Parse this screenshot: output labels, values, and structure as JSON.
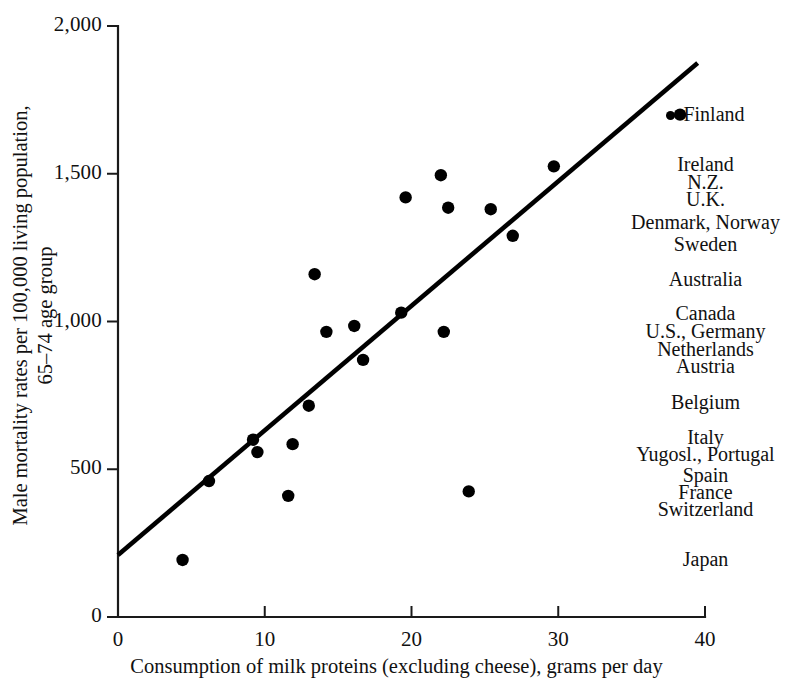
{
  "chart_data": {
    "type": "scatter",
    "title": "",
    "xlabel": "Consumption of milk proteins (excluding cheese), grams per day",
    "ylabel_line1": "Male mortality rates per 100,000 living population,",
    "ylabel_line2": "65–74 age group",
    "xlim": [
      0,
      40
    ],
    "ylim": [
      0,
      2000
    ],
    "xticks": [
      0,
      10,
      20,
      30,
      40
    ],
    "xtick_labels": [
      "0",
      "10",
      "20",
      "30",
      "40"
    ],
    "yticks": [
      0,
      500,
      1000,
      1500,
      2000
    ],
    "ytick_labels": [
      "0",
      "500",
      "1,000",
      "1,500",
      "2,000"
    ],
    "grid": false,
    "legend_position": "right-outside",
    "points": [
      {
        "x": 4.4,
        "y": 193
      },
      {
        "x": 6.2,
        "y": 460
      },
      {
        "x": 9.2,
        "y": 600
      },
      {
        "x": 9.5,
        "y": 558
      },
      {
        "x": 11.6,
        "y": 410
      },
      {
        "x": 11.9,
        "y": 585
      },
      {
        "x": 13.0,
        "y": 715
      },
      {
        "x": 13.4,
        "y": 1160
      },
      {
        "x": 14.2,
        "y": 965
      },
      {
        "x": 16.1,
        "y": 985
      },
      {
        "x": 16.7,
        "y": 870
      },
      {
        "x": 19.3,
        "y": 1030
      },
      {
        "x": 19.6,
        "y": 1420
      },
      {
        "x": 22.0,
        "y": 1495
      },
      {
        "x": 22.2,
        "y": 965
      },
      {
        "x": 22.5,
        "y": 1385
      },
      {
        "x": 23.9,
        "y": 425
      },
      {
        "x": 25.4,
        "y": 1380
      },
      {
        "x": 26.9,
        "y": 1290
      },
      {
        "x": 29.7,
        "y": 1525
      },
      {
        "x": 38.3,
        "y": 1700
      }
    ],
    "trendline": {
      "x0": 0,
      "y0": 210,
      "x1": 39.5,
      "y1": 1875
    },
    "series_name": "Countries",
    "annotations": [
      {
        "label": "Finland",
        "y_value": 1700,
        "has_marker": true
      },
      {
        "label": "Ireland",
        "y_value": 1530,
        "has_marker": false
      },
      {
        "label": "N.Z.",
        "y_value": 1470,
        "has_marker": false
      },
      {
        "label": "U.K.",
        "y_value": 1410,
        "has_marker": false
      },
      {
        "label": "Denmark, Norway",
        "y_value": 1335,
        "has_marker": false
      },
      {
        "label": "Sweden",
        "y_value": 1260,
        "has_marker": false
      },
      {
        "label": "Australia",
        "y_value": 1140,
        "has_marker": false
      },
      {
        "label": "Canada",
        "y_value": 1025,
        "has_marker": false
      },
      {
        "label": "U.S., Germany",
        "y_value": 965,
        "has_marker": false
      },
      {
        "label": "Netherlands",
        "y_value": 905,
        "has_marker": false
      },
      {
        "label": "Austria",
        "y_value": 845,
        "has_marker": false
      },
      {
        "label": "Belgium",
        "y_value": 725,
        "has_marker": false
      },
      {
        "label": "Italy",
        "y_value": 605,
        "has_marker": false
      },
      {
        "label": "Yugosl., Portugal",
        "y_value": 548,
        "has_marker": false
      },
      {
        "label": "Spain",
        "y_value": 478,
        "has_marker": false
      },
      {
        "label": "France",
        "y_value": 420,
        "has_marker": false
      },
      {
        "label": "Switzerland",
        "y_value": 362,
        "has_marker": false
      },
      {
        "label": "Japan",
        "y_value": 193,
        "has_marker": false
      }
    ],
    "colors": {
      "marker": "#000000",
      "trendline": "#000000",
      "axis": "#1a1a1a",
      "background": "#ffffff"
    }
  }
}
